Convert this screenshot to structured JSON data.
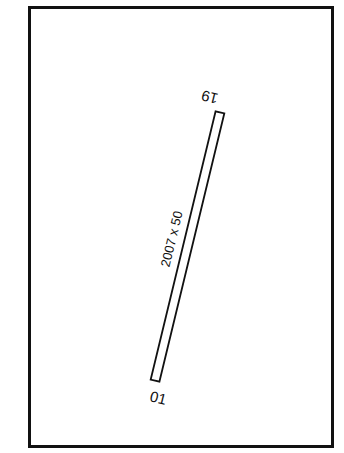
{
  "diagram": {
    "type": "airport-runway-diagram",
    "runway": {
      "dimensions_label": "2007 x 50",
      "end_north_label": "19",
      "end_south_label": "01"
    },
    "colors": {
      "line": "#111111",
      "background": "#ffffff"
    }
  }
}
